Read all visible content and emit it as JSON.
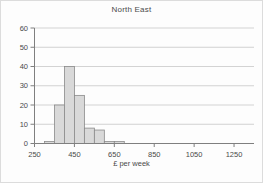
{
  "chart_data": {
    "type": "bar",
    "subtype": "histogram",
    "title": "North East",
    "xlabel": "£ per week",
    "ylabel": "",
    "xlim": [
      250,
      1350
    ],
    "ylim": [
      0,
      60
    ],
    "x_ticks": [
      250,
      450,
      650,
      850,
      1050,
      1250
    ],
    "y_ticks": [
      0,
      10,
      20,
      30,
      40,
      50,
      60
    ],
    "grid": "horizontal",
    "legend": "none",
    "bin_width": 50,
    "bins": [
      {
        "range": "300-350",
        "start": 300,
        "end": 350,
        "value": 1
      },
      {
        "range": "350-400",
        "start": 350,
        "end": 400,
        "value": 20
      },
      {
        "range": "400-450",
        "start": 400,
        "end": 450,
        "value": 40
      },
      {
        "range": "450-500",
        "start": 450,
        "end": 500,
        "value": 25
      },
      {
        "range": "500-550",
        "start": 500,
        "end": 550,
        "value": 8
      },
      {
        "range": "550-600",
        "start": 550,
        "end": 600,
        "value": 7
      },
      {
        "range": "600-650",
        "start": 600,
        "end": 650,
        "value": 1
      },
      {
        "range": "650-700",
        "start": 650,
        "end": 700,
        "value": 1
      }
    ],
    "colors": {
      "bar_fill": "#d9d9d9",
      "bar_stroke": "#8a8a8a",
      "axis": "#7f7f7f",
      "gridline": "#c8c8c8",
      "text": "#4a4a4a",
      "title_text": "#4a4a4a"
    }
  }
}
